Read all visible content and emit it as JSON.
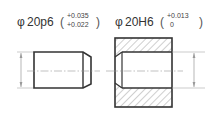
{
  "shaft": {
    "symbol": "φ",
    "designation": "20p6",
    "upper_deviation": "+0.035",
    "lower_deviation": "+0.022",
    "open_paren": "(",
    "close_paren": ")"
  },
  "hole": {
    "symbol": "φ",
    "designation": "20H6",
    "upper_deviation": "+0.013",
    "lower_deviation": "0",
    "open_paren": "(",
    "close_paren": ")"
  },
  "colors": {
    "outline": "#333333",
    "thin_line": "#999999",
    "hatch": "#888888"
  }
}
